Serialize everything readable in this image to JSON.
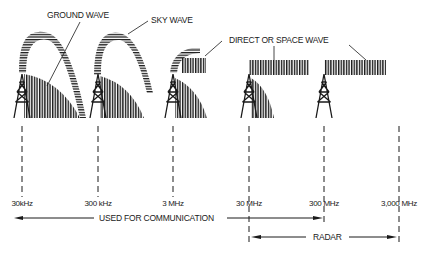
{
  "colors": {
    "ink": "#1a1a1a",
    "background": "#ffffff"
  },
  "labels": {
    "ground_wave": "GROUND WAVE",
    "sky_wave": "SKY WAVE",
    "direct_wave": "DIRECT  OR  SPACE WAVE"
  },
  "frequencies": [
    {
      "label": "30kHz",
      "x": 22
    },
    {
      "label": "300 kHz",
      "x": 98
    },
    {
      "label": "3 MHz",
      "x": 173
    },
    {
      "label": "30 MHz",
      "x": 249
    },
    {
      "label": "300 MHz",
      "x": 324
    },
    {
      "label": "3,000 MHz",
      "x": 399
    }
  ],
  "ranges": {
    "communication": {
      "label": "USED FOR COMMUNICATION",
      "from": "30kHz",
      "to": "300 MHz"
    },
    "radar": {
      "label": "RADAR",
      "from": "30 MHz",
      "to": "3,000 MHz"
    }
  },
  "towers": [
    {
      "band": "30kHz-300kHz",
      "waves": [
        "ground",
        "sky"
      ]
    },
    {
      "band": "300kHz-3MHz",
      "waves": [
        "ground",
        "sky"
      ]
    },
    {
      "band": "3MHz-30MHz",
      "waves": [
        "ground",
        "sky",
        "direct"
      ]
    },
    {
      "band": "30MHz-300MHz",
      "waves": [
        "ground",
        "direct"
      ]
    },
    {
      "band": "300MHz-3000MHz",
      "waves": [
        "direct"
      ]
    }
  ]
}
